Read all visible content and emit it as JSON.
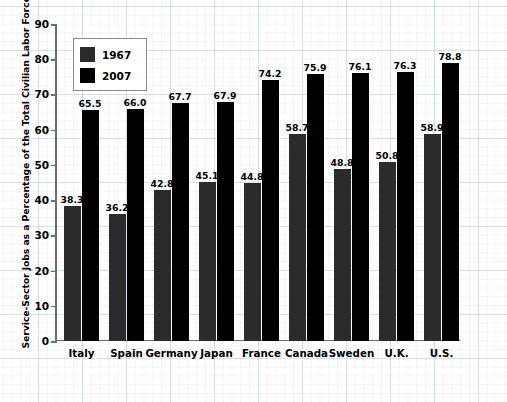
{
  "chart_data": {
    "type": "bar",
    "title": "",
    "subtitle": "",
    "xlabel": "",
    "ylabel": "Service-Sector Jobs as a Percentage of the Total Civilian Labor Force",
    "ylim": [
      0,
      90
    ],
    "yticks": [
      0,
      10,
      20,
      30,
      40,
      50,
      60,
      70,
      80,
      90
    ],
    "grid": true,
    "legend_position": "upper-left-inside",
    "categories": [
      "Italy",
      "Spain",
      "Germany",
      "Japan",
      "France",
      "Canada",
      "Sweden",
      "U.K.",
      "U.S."
    ],
    "series": [
      {
        "name": "1967",
        "color": "#2b2b2b",
        "values": [
          38.3,
          36.2,
          42.8,
          45.1,
          44.8,
          58.7,
          48.8,
          50.8,
          58.9
        ],
        "labels": [
          "38.3",
          "36.2",
          "42.8",
          "45.1",
          "44.8",
          "58.7",
          "48.8",
          "50.8",
          "58.9"
        ]
      },
      {
        "name": "2007",
        "color": "#000000",
        "values": [
          65.5,
          66.0,
          67.7,
          67.9,
          74.2,
          75.9,
          76.1,
          76.3,
          78.8
        ],
        "labels": [
          "65.5",
          "66.0",
          "67.7",
          "67.9",
          "74.2",
          "75.9",
          "76.1",
          "76.3",
          "78.8"
        ]
      }
    ],
    "ytick_labels": [
      "0",
      "10",
      "20",
      "30",
      "40",
      "50",
      "60",
      "70",
      "80",
      "90"
    ]
  },
  "legend": {
    "items": [
      {
        "label": "1967",
        "color": "#2b2b2b"
      },
      {
        "label": "2007",
        "color": "#000000"
      }
    ]
  },
  "source": {
    "text": "SOURCES: Organization for Economic Cooperation and Development, Quarterly Labor Force Statistics, various issues; and OECD in Figures, various years, http://www.sourceoecd.org."
  },
  "colors": {
    "series_1967": "#2b2b2b",
    "series_2007": "#000000",
    "axis": "#6e6e6e",
    "grid": "#96aac3",
    "background": "#ffffff",
    "text": "#000000"
  }
}
